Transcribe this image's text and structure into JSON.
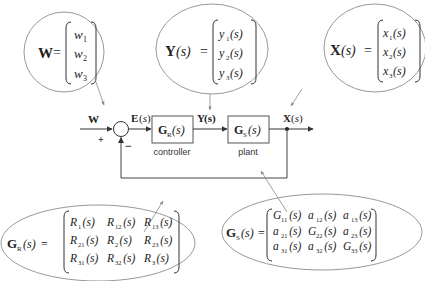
{
  "diagram": {
    "type": "block-diagram",
    "signals": {
      "input": "W",
      "error": "E(s)",
      "control": "Y(s)",
      "output": "X(s)"
    },
    "summing_junction": {
      "plus_sign": "+",
      "minus_sign": "−"
    },
    "blocks": [
      {
        "id": "controller",
        "symbol": "G",
        "subscript": "R",
        "arg": "(s)",
        "label": "controller"
      },
      {
        "id": "plant",
        "symbol": "G",
        "subscript": "S",
        "arg": "(s)",
        "label": "plant"
      }
    ],
    "callouts": {
      "W": {
        "lhs": "W",
        "entries": [
          {
            "base": "w",
            "sub": "1",
            "arg": ""
          },
          {
            "base": "w",
            "sub": "2",
            "arg": ""
          },
          {
            "base": "w",
            "sub": "3",
            "arg": ""
          }
        ]
      },
      "Y": {
        "lhs_bold": "Y",
        "lhs_arg": "(s)",
        "entries": [
          {
            "base": "y",
            "sub": "1",
            "arg": "(s)"
          },
          {
            "base": "y",
            "sub": "2",
            "arg": "(s)"
          },
          {
            "base": "y",
            "sub": "3",
            "arg": "(s)"
          }
        ]
      },
      "X": {
        "lhs_bold": "X",
        "lhs_arg": "(s)",
        "entries": [
          {
            "base": "x",
            "sub": "1",
            "arg": "(s)"
          },
          {
            "base": "x",
            "sub": "2",
            "arg": "(s)"
          },
          {
            "base": "x",
            "sub": "3",
            "arg": "(s)"
          }
        ]
      },
      "GR": {
        "lhs_bold": "G",
        "lhs_sub": "R",
        "lhs_arg": "(s)",
        "matrix": [
          [
            {
              "b": "R",
              "s": "1"
            },
            {
              "b": "R",
              "s": "12"
            },
            {
              "b": "R",
              "s": "13"
            }
          ],
          [
            {
              "b": "R",
              "s": "21"
            },
            {
              "b": "R",
              "s": "2"
            },
            {
              "b": "R",
              "s": "23"
            }
          ],
          [
            {
              "b": "R",
              "s": "31"
            },
            {
              "b": "R",
              "s": "32"
            },
            {
              "b": "R",
              "s": "3"
            }
          ]
        ],
        "arg": "(s)"
      },
      "GS": {
        "lhs_bold": "G",
        "lhs_sub": "S",
        "lhs_arg": "(s)",
        "matrix": [
          [
            {
              "b": "G",
              "s": "11"
            },
            {
              "b": "a",
              "s": "12"
            },
            {
              "b": "a",
              "s": "13"
            }
          ],
          [
            {
              "b": "a",
              "s": "21"
            },
            {
              "b": "G",
              "s": "22"
            },
            {
              "b": "a",
              "s": "23"
            }
          ],
          [
            {
              "b": "a",
              "s": "31"
            },
            {
              "b": "a",
              "s": "32"
            },
            {
              "b": "G",
              "s": "33"
            }
          ]
        ],
        "arg": "(s)"
      }
    },
    "equals": "=",
    "colors": {
      "line": "#444444",
      "ellipse": "#888888",
      "arrow_thin": "#777777",
      "background": "#ffffff"
    }
  }
}
